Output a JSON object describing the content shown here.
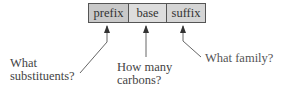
{
  "diagram": {
    "cells": [
      {
        "label": "prefix",
        "color": "#c9c9c9"
      },
      {
        "label": "base",
        "color": "#dddddd"
      },
      {
        "label": "suffix",
        "color": "#d5d5d5"
      }
    ],
    "questions": {
      "prefix": {
        "line1": "What",
        "line2": "substituents?"
      },
      "base": {
        "line1": "How many",
        "line2": "carbons?"
      },
      "suffix": {
        "line1": "What family?"
      }
    },
    "border_color": "#555555",
    "arrow_color": "#555555"
  }
}
